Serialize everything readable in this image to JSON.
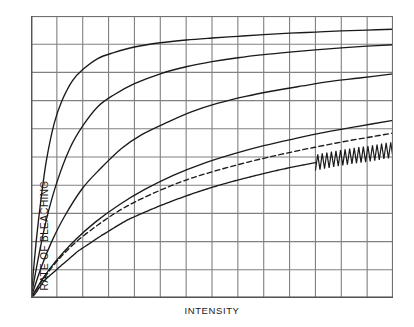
{
  "chart_data": {
    "type": "line",
    "title": "",
    "subtitle": "",
    "xlabel": "INTENSITY",
    "ylabel": "RATE OF BLEACHING",
    "xlim": [
      0,
      14
    ],
    "ylim": [
      0,
      10
    ],
    "grid": true,
    "grid_color": "#808080",
    "grid_cols": 14,
    "grid_rows": 10,
    "xticklabels": [],
    "yticklabels": [],
    "legend": "none",
    "axes_note": "Unlabeled axes; saturating rate-vs-intensity curves all rising from the origin",
    "series": [
      {
        "name": "curve-1",
        "style": "solid",
        "color": "#1a1a1a",
        "saturation_level": 9.3,
        "half_saturation_x": 0.75,
        "x": [
          0,
          0.2,
          0.4,
          0.6,
          0.9,
          1.2,
          1.6,
          2.0,
          2.6,
          3.2,
          4.0,
          5.0,
          6.0,
          7.0,
          8.0,
          9.0,
          10.0,
          11.0,
          12.0,
          13.0,
          14.0
        ],
        "y": [
          0,
          2.0,
          3.6,
          4.9,
          6.2,
          7.0,
          7.7,
          8.1,
          8.5,
          8.7,
          8.9,
          9.05,
          9.15,
          9.22,
          9.28,
          9.34,
          9.39,
          9.43,
          9.47,
          9.5,
          9.53
        ]
      },
      {
        "name": "curve-2",
        "style": "solid",
        "color": "#1a1a1a",
        "saturation_level": 8.6,
        "half_saturation_x": 1.5,
        "x": [
          0,
          0.3,
          0.6,
          1.0,
          1.5,
          2.0,
          2.6,
          3.2,
          4.0,
          5.0,
          6.0,
          7.0,
          8.0,
          9.0,
          10.0,
          11.0,
          12.0,
          13.0,
          14.0
        ],
        "y": [
          0,
          1.5,
          2.8,
          4.1,
          5.3,
          6.1,
          6.8,
          7.2,
          7.6,
          7.95,
          8.2,
          8.38,
          8.52,
          8.63,
          8.72,
          8.8,
          8.87,
          8.93,
          8.98
        ]
      },
      {
        "name": "curve-3",
        "style": "solid",
        "color": "#1a1a1a",
        "saturation_level": 7.4,
        "half_saturation_x": 2.6,
        "x": [
          0,
          0.4,
          0.8,
          1.3,
          2.0,
          2.7,
          3.5,
          4.3,
          5.2,
          6.2,
          7.2,
          8.3,
          9.4,
          10.5,
          11.6,
          12.7,
          14.0
        ],
        "y": [
          0,
          1.1,
          2.0,
          2.9,
          3.9,
          4.6,
          5.3,
          5.8,
          6.2,
          6.6,
          6.9,
          7.15,
          7.35,
          7.52,
          7.68,
          7.8,
          7.95
        ]
      },
      {
        "name": "curve-4",
        "style": "solid",
        "color": "#1a1a1a",
        "saturation_level": 5.6,
        "half_saturation_x": 4.2,
        "x": [
          0,
          0.5,
          1.0,
          1.7,
          2.5,
          3.4,
          4.4,
          5.5,
          6.6,
          7.8,
          9.0,
          10.2,
          11.4,
          12.6,
          14.0
        ],
        "y": [
          0,
          0.75,
          1.35,
          2.05,
          2.7,
          3.3,
          3.85,
          4.35,
          4.75,
          5.1,
          5.4,
          5.65,
          5.88,
          6.08,
          6.3
        ]
      },
      {
        "name": "curve-5-noisy",
        "style": "solid-with-oscillation",
        "color": "#1a1a1a",
        "saturation_level": 4.4,
        "half_saturation_x": 5.5,
        "noise_start_x": 11.0,
        "noise_amplitude": 0.28,
        "noise_cycles": 17,
        "x": [
          0,
          0.5,
          1.1,
          1.8,
          2.7,
          3.7,
          4.8,
          6.0,
          7.2,
          8.5,
          9.8,
          11.0,
          12.2,
          13.1,
          14.0
        ],
        "y": [
          0,
          0.6,
          1.1,
          1.65,
          2.2,
          2.75,
          3.2,
          3.62,
          3.98,
          4.3,
          4.58,
          4.8,
          5.0,
          5.12,
          5.25
        ]
      },
      {
        "name": "dashed-curve",
        "style": "dashed",
        "color": "#1a1a1a",
        "saturation_level": 4.9,
        "half_saturation_x": 4.6,
        "x": [
          0,
          0.5,
          1.0,
          1.7,
          2.6,
          3.6,
          4.7,
          5.9,
          7.1,
          8.4,
          9.7,
          11.0,
          12.3,
          13.2,
          14.0
        ],
        "y": [
          0,
          0.7,
          1.3,
          1.95,
          2.6,
          3.2,
          3.7,
          4.15,
          4.5,
          4.82,
          5.1,
          5.35,
          5.58,
          5.72,
          5.85
        ]
      }
    ]
  }
}
